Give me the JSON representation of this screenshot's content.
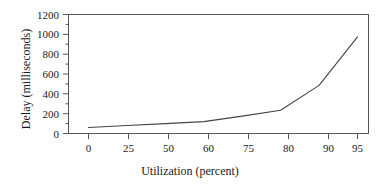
{
  "chart_data": {
    "type": "line",
    "title": "",
    "xlabel": "Utilization (percent)",
    "ylabel": "Delay (milliseconds)",
    "x_tick_labels": [
      "0",
      "25",
      "50",
      "60",
      "75",
      "80",
      "90",
      "95"
    ],
    "x_values": [
      0,
      25,
      50,
      60,
      75,
      80,
      90,
      95
    ],
    "x_axis_scale": "categorical-evenly-spaced",
    "y_tick_labels": [
      "0",
      "200",
      "400",
      "600",
      "800",
      "1000",
      "1200"
    ],
    "y_ticks": [
      0,
      200,
      400,
      600,
      800,
      1000,
      1200
    ],
    "ylim": [
      0,
      1200
    ],
    "grid": false,
    "legend": false,
    "series": [
      {
        "name": "Delay",
        "color": "#444444",
        "categories": [
          "0",
          "25",
          "50",
          "60",
          "75",
          "80",
          "90",
          "95"
        ],
        "values": [
          60,
          80,
          100,
          120,
          175,
          235,
          485,
          975
        ]
      }
    ],
    "line_color": "#444444",
    "axis_color": "#555555"
  },
  "axes": {
    "y_title": "Delay (milliseconds)",
    "x_title": "Utilization (percent)"
  }
}
